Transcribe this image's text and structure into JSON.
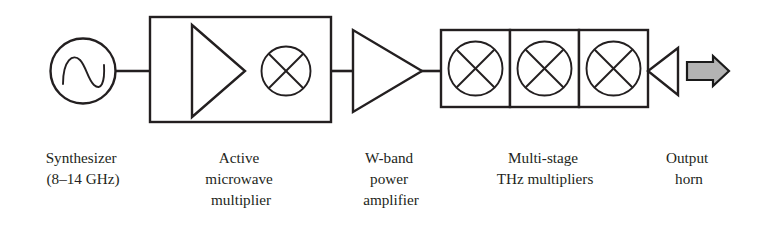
{
  "figure": {
    "background_color": "#ffffff",
    "line_color": "#231f20",
    "arrow_fill_color": "#b3b3b3"
  },
  "blocks": [
    {
      "id": "synthesizer",
      "symbol": "sine-source-circle",
      "caption_lines": [
        "Synthesizer",
        "(8–14 GHz)"
      ]
    },
    {
      "id": "active-microwave-multiplier",
      "symbol": "box-with-amplifier-and-mixer",
      "caption_lines": [
        "Active",
        "microwave",
        "multiplier"
      ]
    },
    {
      "id": "w-band-power-amplifier",
      "symbol": "amplifier-triangle",
      "caption_lines": [
        "W-band",
        "power",
        "amplifier"
      ]
    },
    {
      "id": "multi-stage-thz-multipliers",
      "symbol": "three-mixer-boxes",
      "caption_lines": [
        "Multi-stage",
        "THz multipliers"
      ]
    },
    {
      "id": "output-horn",
      "symbol": "horn-triangle-with-beam-arrow",
      "caption_lines": [
        "Output",
        "horn"
      ]
    }
  ],
  "captions": {
    "synthesizer": {
      "line1": "Synthesizer",
      "line2": "(8–14 GHz)",
      "x": 83
    },
    "active_multiplier": {
      "line1": "Active",
      "line2": "microwave",
      "line3": "multiplier",
      "x": 241
    },
    "wband_amplifier": {
      "line1": "W-band",
      "line2": "power",
      "line3": "amplifier",
      "x": 391
    },
    "thz_multipliers": {
      "line1": "Multi-stage",
      "line2": "THz multipliers",
      "x": 545
    },
    "output_horn": {
      "line1": "Output",
      "line2": "horn",
      "x": 689
    }
  },
  "icons": {
    "sine_wave": "sine-wave-icon",
    "mixer_cross": "mixer-cross-icon",
    "amplifier": "amplifier-triangle-icon",
    "beam_arrow": "beam-arrow-icon"
  }
}
